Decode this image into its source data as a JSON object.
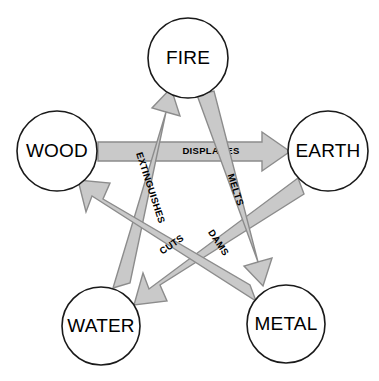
{
  "diagram": {
    "type": "pentagram-cycle",
    "canvas": {
      "width": 379,
      "height": 381
    },
    "colors": {
      "background": "#ffffff",
      "node_fill": "#ffffff",
      "node_stroke": "#1a1a1a",
      "arrow_fill": "#c9c9c9",
      "arrow_stroke": "#8c8c8c",
      "text": "#000000"
    },
    "nodes": [
      {
        "id": "fire",
        "label": "FIRE",
        "cx": 188,
        "cy": 58,
        "r": 40
      },
      {
        "id": "earth",
        "label": "EARTH",
        "cx": 328,
        "cy": 151,
        "r": 40
      },
      {
        "id": "metal",
        "label": "METAL",
        "cx": 286,
        "cy": 324,
        "r": 39
      },
      {
        "id": "water",
        "label": "WATER",
        "cx": 101,
        "cy": 326,
        "r": 39
      },
      {
        "id": "wood",
        "label": "WOOD",
        "cx": 57,
        "cy": 151,
        "r": 40
      }
    ],
    "edges": [
      {
        "id": "wood-earth",
        "from": "WOOD",
        "to": "EARTH",
        "label": "DISPLACES",
        "label_rotation": 0
      },
      {
        "id": "earth-water",
        "from": "EARTH",
        "to": "WATER",
        "label": "DAMS",
        "label_rotation": 56
      },
      {
        "id": "water-fire",
        "from": "WATER",
        "to": "FIRE",
        "label": "EXTINGUISHES",
        "label_rotation": 72
      },
      {
        "id": "fire-metal",
        "from": "FIRE",
        "to": "METAL",
        "label": "MELTS",
        "label_rotation": 72
      },
      {
        "id": "metal-wood",
        "from": "METAL",
        "to": "WOOD",
        "label": "CUTS",
        "label_rotation": -34
      }
    ]
  }
}
